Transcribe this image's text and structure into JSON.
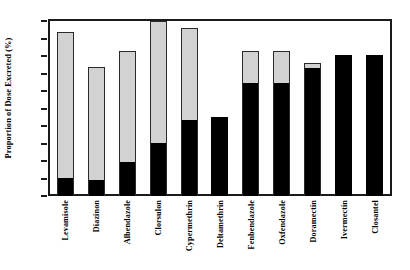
{
  "chart_data": {
    "type": "bar",
    "title": "",
    "subtitle": "",
    "xlabel": "",
    "ylabel": "Proportion of Dose Excreted (%)",
    "ylim": [
      0,
      100
    ],
    "yticks": [
      0,
      10,
      20,
      30,
      40,
      50,
      60,
      70,
      80,
      90,
      100
    ],
    "grid": false,
    "legend": "none",
    "stacked": true,
    "categories": [
      "Levamisole",
      "Diazinon",
      "Albendazole",
      "Clorsulon",
      "Cypermethrin",
      "Deltamethrin",
      "Fenbendazole",
      "Oxfendazole",
      "Doramectin",
      "Ivermectin",
      "Closantel"
    ],
    "series": [
      {
        "name": "Faeces",
        "color": "#000000",
        "values": [
          11,
          10,
          20,
          31,
          44,
          45,
          65,
          65,
          74,
          80.5,
          80.5
        ]
      },
      {
        "name": "Urine",
        "color": "#d2d2d2",
        "values": [
          83,
          64,
          63,
          69,
          52,
          0,
          18,
          18,
          2,
          0,
          0
        ]
      }
    ],
    "totals": [
      94,
      74,
      83,
      100,
      96,
      45,
      83,
      83,
      76,
      80.5,
      80.5
    ],
    "colors": {
      "black_segment": "#000000",
      "gray_segment": "#d2d2d2",
      "axis": "#1a1a1a",
      "background": "#ffffff"
    }
  }
}
